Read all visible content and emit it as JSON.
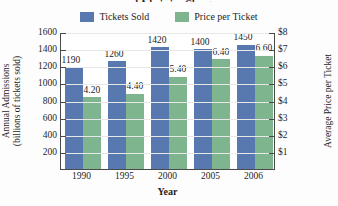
{
  "chart_data": {
    "type": "bar",
    "title": "and Admission Charge",
    "title_clipped": true,
    "xlabel": "Year",
    "ylabel": "Annual Admissions",
    "ylabel_line2": "(billions of tickets sold)",
    "ylabel_right": "Average Price per Ticket",
    "categories": [
      "1990",
      "1995",
      "2000",
      "2005",
      "2006"
    ],
    "series": [
      {
        "name": "Tickets Sold",
        "color": "#5878b0",
        "axis": "left",
        "values": [
          1190,
          1260,
          1420,
          1400,
          1450
        ],
        "labels": [
          "1190",
          "1260",
          "1420",
          "1400",
          "1450"
        ]
      },
      {
        "name": "Price per Ticket",
        "color": "#7fb58e",
        "axis": "right",
        "values": [
          4.2,
          4.4,
          5.4,
          6.4,
          6.6
        ],
        "labels": [
          "4.20",
          "4.40",
          "5.40",
          "6.40",
          "6.60"
        ]
      }
    ],
    "yticks_left": [
      "1600",
      "1400",
      "1200",
      "1000",
      "800",
      "600",
      "400",
      "200"
    ],
    "ylim_left": [
      0,
      1600
    ],
    "yticks_right": [
      "$8",
      "$7",
      "$6",
      "$5",
      "$4",
      "$3",
      "$2",
      "$1"
    ],
    "ylim_right": [
      0,
      8
    ],
    "grid": true,
    "legend_position": "top"
  },
  "legend": {
    "items": [
      {
        "label": "Tickets Sold",
        "color": "#5878b0"
      },
      {
        "label": "Price per Ticket",
        "color": "#7fb58e"
      }
    ]
  }
}
